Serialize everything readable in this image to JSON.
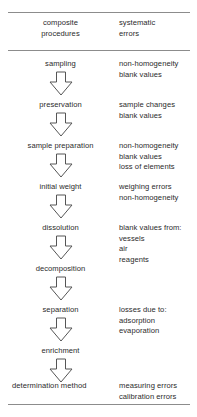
{
  "figure": {
    "title_hidden": "",
    "columns": {
      "left_header": "composite\nprocedures",
      "right_header": "systematic\nerrors"
    },
    "header": {
      "left_line1": "composite",
      "left_line2": "procedures",
      "right_line1": "systematic",
      "right_line2": "errors"
    },
    "steps": [
      {
        "step": "sampling",
        "errors": [
          "non-homogeneity",
          "blank values"
        ]
      },
      {
        "step": "preservation",
        "errors": [
          "sample changes",
          "blank values"
        ]
      },
      {
        "step": "sample preparation",
        "errors": [
          "non-homogeneity",
          "blank values",
          "loss of elements"
        ]
      },
      {
        "step": "initial weight",
        "errors": [
          "weighing errors",
          "non-homogeneity"
        ]
      },
      {
        "step": "dissolution",
        "errors": [
          "blank values from:",
          "vessels",
          "air",
          "reagents"
        ]
      },
      {
        "step": "decomposition",
        "errors": []
      },
      {
        "step": "separation",
        "errors": [
          "losses due to:",
          "adsorption",
          "evaporation"
        ]
      },
      {
        "step": "enrichment",
        "errors": []
      },
      {
        "step": "determination method",
        "errors": [
          "measuring errors",
          "calibration errors"
        ]
      }
    ],
    "arrow_icon": "down-arrow-outline",
    "colors": {
      "rule": "#8c8c8c",
      "text": "#2b2b2b",
      "arrow_stroke": "#555555",
      "background": "#ffffff"
    }
  }
}
